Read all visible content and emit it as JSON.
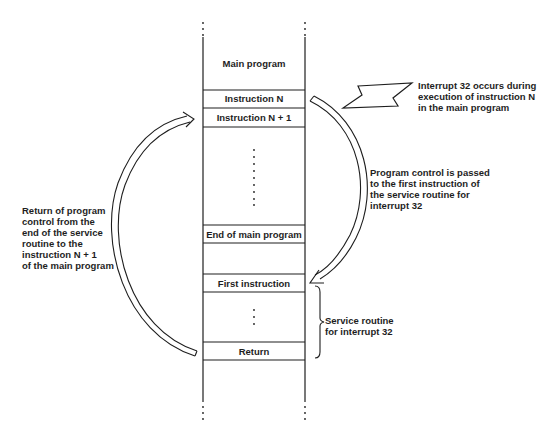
{
  "memory_column": {
    "main_program_label": "Main program",
    "cells": {
      "instruction_n": "Instruction N",
      "instruction_n_plus_1": "Instruction N + 1",
      "end_of_main": "End of main program",
      "first_instruction": "First instruction",
      "return": "Return"
    }
  },
  "annotations": {
    "interrupt_occurs": "Interrupt 32 occurs during\nexecution of instruction N\nin the main program",
    "control_passed": "Program control is passed\nto the first instruction of\nthe service routine for\ninterrupt 32",
    "return_control": "Return of program\ncontrol from the\nend of the service\nroutine to the\ninstruction N + 1\nof the main program",
    "service_routine": "Service routine\nfor interrupt 32"
  },
  "colors": {
    "line": "#1e1e1e",
    "background": "#ffffff"
  }
}
